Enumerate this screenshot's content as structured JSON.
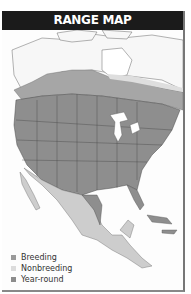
{
  "title": "RANGE MAP",
  "colors": {
    "title_bar": "#1b1b1b",
    "breeding": "#9a9a9a",
    "nonbreeding": "#d4d4d4",
    "year_round": "#8a8a8a",
    "land_unshaded": "#f7f7f7",
    "water": "#ffffff",
    "borders": "#555555"
  },
  "legend": [
    {
      "label": "Breeding",
      "icon": "breeding-swatch",
      "color": "#9a9a9a"
    },
    {
      "label": "Nonbreeding",
      "icon": "nonbreeding-swatch",
      "color": "#dcdcdc"
    },
    {
      "label": "Year-round",
      "icon": "year-round-swatch",
      "color": "#8c8c8c"
    }
  ],
  "map": {
    "region": "North America",
    "shaded_regions": [
      {
        "area": "Southern Canada and contiguous United States",
        "category": "Year-round"
      },
      {
        "area": "Central Canada",
        "category": "Breeding"
      },
      {
        "area": "Mexico and Central America",
        "category": "Nonbreeding"
      }
    ]
  }
}
